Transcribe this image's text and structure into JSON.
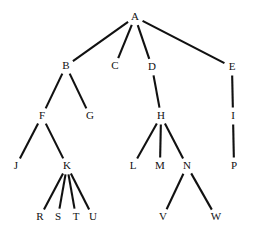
{
  "diagram": {
    "type": "tree",
    "background_color": "#ffffff",
    "edge_color": "#111111",
    "label_color": "#111111",
    "edge_width": 2.1,
    "canvas": {
      "width": 254,
      "height": 242
    },
    "root": "A",
    "nodes": [
      {
        "id": "A",
        "label": "A",
        "x": 135,
        "y": 17,
        "level": 0
      },
      {
        "id": "B",
        "label": "B",
        "x": 66,
        "y": 66,
        "level": 1
      },
      {
        "id": "C",
        "label": "C",
        "x": 115,
        "y": 66,
        "level": 1
      },
      {
        "id": "D",
        "label": "D",
        "x": 152,
        "y": 67,
        "level": 1
      },
      {
        "id": "E",
        "label": "E",
        "x": 232,
        "y": 67,
        "level": 1
      },
      {
        "id": "F",
        "label": "F",
        "x": 42,
        "y": 116,
        "level": 2
      },
      {
        "id": "G",
        "label": "G",
        "x": 90,
        "y": 116,
        "level": 2
      },
      {
        "id": "H",
        "label": "H",
        "x": 161,
        "y": 116,
        "level": 2
      },
      {
        "id": "I",
        "label": "I",
        "x": 233,
        "y": 116,
        "level": 2
      },
      {
        "id": "J",
        "label": "J",
        "x": 16,
        "y": 166,
        "level": 3
      },
      {
        "id": "K",
        "label": "K",
        "x": 67,
        "y": 166,
        "level": 3
      },
      {
        "id": "L",
        "label": "L",
        "x": 133,
        "y": 166,
        "level": 3
      },
      {
        "id": "M",
        "label": "M",
        "x": 160,
        "y": 166,
        "level": 3
      },
      {
        "id": "N",
        "label": "N",
        "x": 187,
        "y": 166,
        "level": 3
      },
      {
        "id": "P",
        "label": "P",
        "x": 234,
        "y": 166,
        "level": 3
      },
      {
        "id": "R",
        "label": "R",
        "x": 40,
        "y": 217,
        "level": 4
      },
      {
        "id": "S",
        "label": "S",
        "x": 58,
        "y": 217,
        "level": 4
      },
      {
        "id": "T",
        "label": "T",
        "x": 76,
        "y": 217,
        "level": 4
      },
      {
        "id": "U",
        "label": "U",
        "x": 93,
        "y": 217,
        "level": 4
      },
      {
        "id": "V",
        "label": "V",
        "x": 163,
        "y": 217,
        "level": 4
      },
      {
        "id": "W",
        "label": "W",
        "x": 216,
        "y": 217,
        "level": 4
      }
    ],
    "edges": [
      {
        "from": "A",
        "to": "B"
      },
      {
        "from": "A",
        "to": "C"
      },
      {
        "from": "A",
        "to": "D"
      },
      {
        "from": "A",
        "to": "E"
      },
      {
        "from": "B",
        "to": "F"
      },
      {
        "from": "B",
        "to": "G"
      },
      {
        "from": "D",
        "to": "H"
      },
      {
        "from": "E",
        "to": "I"
      },
      {
        "from": "F",
        "to": "J"
      },
      {
        "from": "F",
        "to": "K"
      },
      {
        "from": "H",
        "to": "L"
      },
      {
        "from": "H",
        "to": "M"
      },
      {
        "from": "H",
        "to": "N"
      },
      {
        "from": "I",
        "to": "P"
      },
      {
        "from": "K",
        "to": "R"
      },
      {
        "from": "K",
        "to": "S"
      },
      {
        "from": "K",
        "to": "T"
      },
      {
        "from": "K",
        "to": "U"
      },
      {
        "from": "N",
        "to": "V"
      },
      {
        "from": "N",
        "to": "W"
      }
    ]
  }
}
